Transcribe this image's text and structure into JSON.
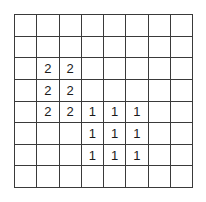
{
  "figure": {
    "name": "number-grid",
    "rows": 8,
    "columns": 8,
    "grid_line_color": "#3a3a3a",
    "background_color": "#ffffff",
    "text_color": "#1a1a1a"
  },
  "chart_data": {
    "type": "table",
    "title": "",
    "xlabel": "",
    "ylabel": "",
    "grid": true,
    "rows": 8,
    "columns": 8,
    "cells": [
      [
        "",
        "",
        "",
        "",
        "",
        "",
        "",
        ""
      ],
      [
        "",
        "",
        "",
        "",
        "",
        "",
        "",
        ""
      ],
      [
        "",
        "2",
        "2",
        "",
        "",
        "",
        "",
        ""
      ],
      [
        "",
        "2",
        "2",
        "",
        "",
        "",
        "",
        ""
      ],
      [
        "",
        "2",
        "2",
        "1",
        "1",
        "1",
        "",
        ""
      ],
      [
        "",
        "",
        "",
        "1",
        "1",
        "1",
        "",
        ""
      ],
      [
        "",
        "",
        "",
        "1",
        "1",
        "1",
        "",
        ""
      ],
      [
        "",
        "",
        "",
        "",
        "",
        "",
        "",
        ""
      ]
    ],
    "regions": [
      {
        "value": "2",
        "row_start": 3,
        "row_end": 5,
        "column_start": 2,
        "column_end": 3,
        "count": 6
      },
      {
        "value": "1",
        "row_start": 5,
        "row_end": 7,
        "column_start": 4,
        "column_end": 6,
        "count": 9
      }
    ]
  }
}
